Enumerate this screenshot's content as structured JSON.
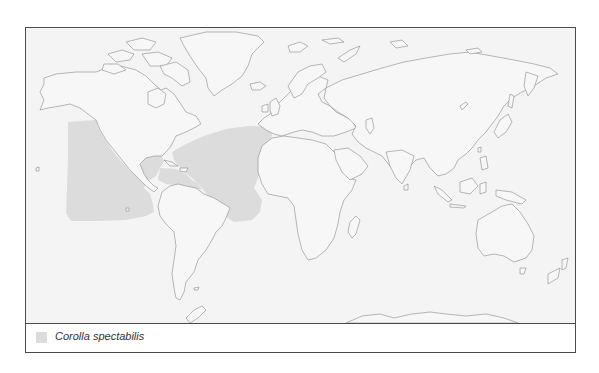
{
  "map": {
    "type": "world distribution map",
    "background_color": "#f4f4f4",
    "land_outline_color": "#8a8a8a",
    "range_fill_color": "#dcdcdc",
    "frame_color": "#4a4a4a"
  },
  "legend": {
    "items": [
      {
        "label": "Corolla spectabilis",
        "swatch_color": "#dcdcdc"
      }
    ]
  }
}
